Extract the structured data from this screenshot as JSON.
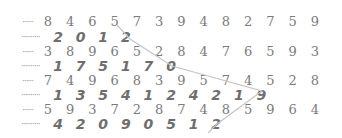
{
  "rows": [
    {
      "type": "serif",
      "leader": "······",
      "digits": [
        "8",
        "4",
        "6",
        "5",
        "7",
        "3",
        "9",
        "4",
        "8",
        "2",
        "7",
        "5",
        "9"
      ]
    },
    {
      "type": "bold",
      "leader": "··········",
      "digits": [
        "2",
        "0",
        "1",
        "2"
      ]
    },
    {
      "type": "serif",
      "leader": "······",
      "digits": [
        "3",
        "8",
        "9",
        "6",
        "5",
        "2",
        "8",
        "4",
        "7",
        "6",
        "5",
        "9",
        "3"
      ]
    },
    {
      "type": "bold",
      "leader": "··········",
      "digits": [
        "1",
        "7",
        "5",
        "1",
        "7",
        "0"
      ]
    },
    {
      "type": "serif",
      "leader": "······",
      "digits": [
        "7",
        "4",
        "9",
        "6",
        "8",
        "3",
        "9",
        "5",
        "7",
        "4",
        "5",
        "2",
        "8"
      ]
    },
    {
      "type": "bold",
      "leader": "··········",
      "digits": [
        "1",
        "3",
        "5",
        "4",
        "1",
        "2",
        "4",
        "2",
        "1",
        "9"
      ]
    },
    {
      "type": "serif",
      "leader": "······",
      "digits": [
        "5",
        "9",
        "3",
        "7",
        "2",
        "8",
        "7",
        "4",
        "8",
        "5",
        "9",
        "6",
        "4"
      ]
    },
    {
      "type": "bold",
      "leader": "··········",
      "digits": [
        "4",
        "2",
        "0",
        "9",
        "0",
        "5",
        "1",
        "2"
      ]
    }
  ],
  "connector": {
    "color": "#c4c4c4",
    "points": [
      [
        117,
        25
      ],
      [
        130,
        39
      ],
      [
        172,
        66
      ],
      [
        262,
        91
      ],
      [
        217,
        124
      ],
      [
        208,
        133
      ]
    ]
  }
}
